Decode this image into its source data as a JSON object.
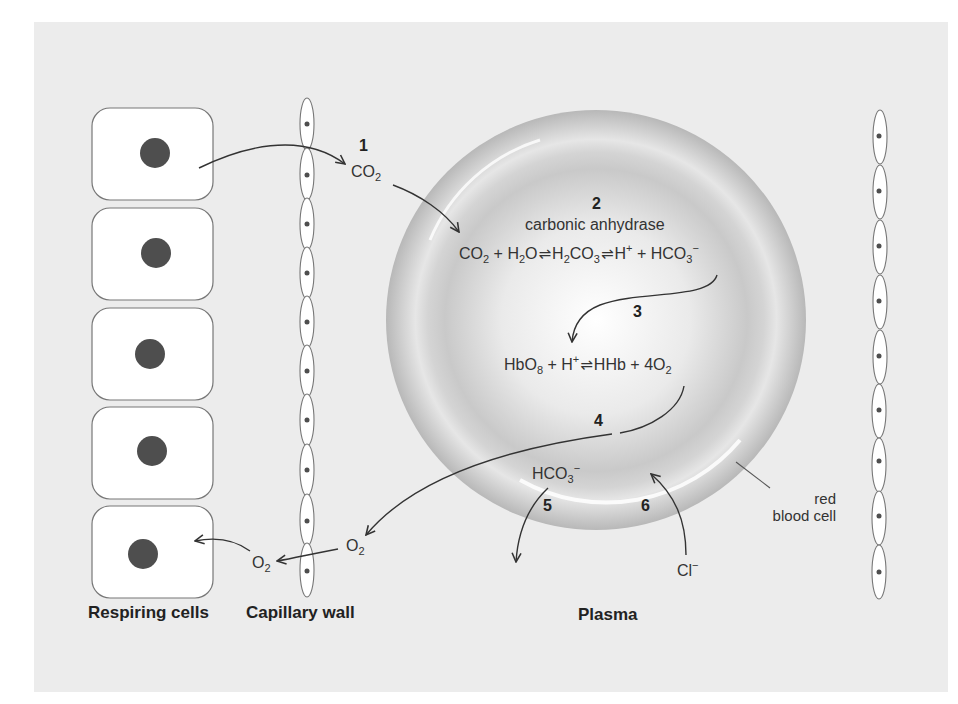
{
  "figure": {
    "captions": {
      "respiring_cells": "Respiring cells",
      "capillary_wall": "Capillary wall",
      "plasma": "Plasma"
    },
    "rbc_label": [
      "red",
      "blood cell"
    ],
    "steps": {
      "s1": "1",
      "s2": "2",
      "s3": "3",
      "s4": "4",
      "s5": "5",
      "s6": "6"
    },
    "enzyme": "carbonic anhydrase",
    "species": {
      "co2_plasma": {
        "base": "CO",
        "sub": "2"
      },
      "o2_plasma": {
        "base": "O",
        "sub": "2"
      },
      "o2_tissue": {
        "base": "O",
        "sub": "2"
      },
      "hco3_out": {
        "base": "HCO",
        "sub": "3",
        "sup": "−"
      },
      "cl_in": {
        "base": "Cl",
        "sup": "−"
      }
    },
    "equation_1": {
      "terms": [
        {
          "base": "CO",
          "sub": "2"
        },
        {
          "op": "+"
        },
        {
          "base": "H",
          "sub": "2",
          "tail": "O"
        },
        {
          "arrow": "⇌"
        },
        {
          "base": "H",
          "sub": "2",
          "tail": "CO",
          "sub2": "3"
        },
        {
          "arrow": "⇌"
        },
        {
          "base": "H",
          "sup": "+"
        },
        {
          "op": "+"
        },
        {
          "base": "HCO",
          "sub": "3",
          "sup": "−"
        }
      ],
      "text": "CO2 + H2O ⇌ H2CO3 ⇌ H+ + HCO3−"
    },
    "equation_2": {
      "terms": [
        {
          "base": "HbO",
          "sub": "8"
        },
        {
          "op": "+"
        },
        {
          "base": "H",
          "sup": "+"
        },
        {
          "arrow": "⇌"
        },
        {
          "base": "HHb"
        },
        {
          "op": "+"
        },
        {
          "base": "4O",
          "sub": "2"
        }
      ],
      "text": "HbO8 + H+ ⇌ HHb + 4O2"
    },
    "colors": {
      "panel_bg": "#ececec",
      "cell_fill": "#ffffff",
      "cell_stroke": "#777777",
      "nucleus": "#4e4e4e",
      "arrow": "#333333",
      "rbc_rim": "#bdbdbd",
      "rbc_center": "#ffffff"
    },
    "counts": {
      "respiring_cells": 5,
      "left_wall_cells": 10,
      "right_wall_cells": 9
    }
  }
}
